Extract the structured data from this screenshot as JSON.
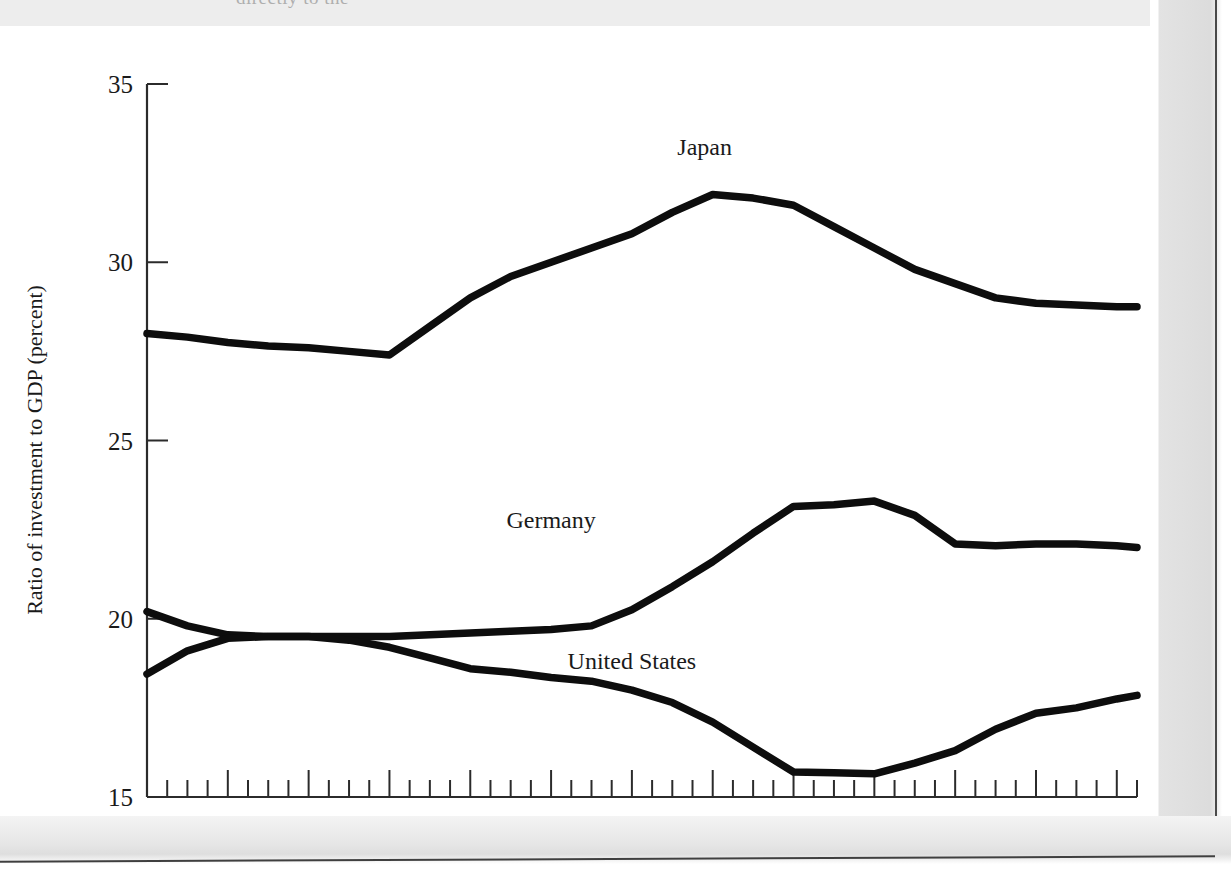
{
  "page": {
    "top_bleed_text": "directly to the",
    "background_color": "#ffffff",
    "line_color": "#0d0d0d",
    "axis_color": "#2b2b2b"
  },
  "chart_data": {
    "type": "line",
    "title": "",
    "xlabel": "",
    "ylabel": "Ratio of investment to GDP (percent)",
    "xlim": [
      1983.0,
      1995.25
    ],
    "ylim": [
      15,
      35
    ],
    "grid": false,
    "legend_position": "inline-labels",
    "y_ticks": [
      15,
      20,
      25,
      30,
      35
    ],
    "y_tick_labels": [
      "15",
      "20",
      "25",
      "30",
      "35"
    ],
    "x_ticks": [
      1984,
      1986,
      1988,
      1990,
      1992,
      1994
    ],
    "x_tick_labels": [
      "1984",
      "1986",
      "1988",
      "1990",
      "1992",
      "1994"
    ],
    "x_major_ticks": [
      1983,
      1984,
      1985,
      1986,
      1987,
      1988,
      1989,
      1990,
      1991,
      1992,
      1993,
      1994,
      1995
    ],
    "x_minor_tick_interval": 0.25,
    "x": [
      1983.0,
      1983.5,
      1984.0,
      1984.5,
      1985.0,
      1985.5,
      1986.0,
      1986.5,
      1987.0,
      1987.5,
      1988.0,
      1988.5,
      1989.0,
      1989.5,
      1990.0,
      1990.5,
      1991.0,
      1991.5,
      1992.0,
      1992.5,
      1993.0,
      1993.5,
      1994.0,
      1994.5,
      1995.0,
      1995.25
    ],
    "series": [
      {
        "name": "Japan",
        "label": "Japan",
        "label_x": 1989.9,
        "label_y": 33.0,
        "values": [
          28.0,
          27.9,
          27.75,
          27.65,
          27.6,
          27.5,
          27.4,
          28.2,
          29.0,
          29.6,
          30.0,
          30.4,
          30.8,
          31.4,
          31.9,
          31.8,
          31.6,
          31.0,
          30.4,
          29.8,
          29.4,
          29.0,
          28.85,
          28.8,
          28.75,
          28.75
        ]
      },
      {
        "name": "Germany",
        "label": "Germany",
        "label_x": 1988.0,
        "label_y": 22.55,
        "values": [
          20.2,
          19.8,
          19.55,
          19.5,
          19.5,
          19.5,
          19.5,
          19.55,
          19.6,
          19.65,
          19.7,
          19.8,
          20.25,
          20.9,
          21.6,
          22.4,
          23.15,
          23.2,
          23.3,
          22.9,
          22.1,
          22.05,
          22.1,
          22.1,
          22.05,
          22.0
        ]
      },
      {
        "name": "United States",
        "label": "United States",
        "label_x": 1989.0,
        "label_y": 18.6,
        "values": [
          18.45,
          19.1,
          19.45,
          19.5,
          19.5,
          19.4,
          19.2,
          18.9,
          18.6,
          18.5,
          18.35,
          18.25,
          18.0,
          17.65,
          17.1,
          16.4,
          15.7,
          15.68,
          15.65,
          15.95,
          16.3,
          16.9,
          17.35,
          17.5,
          17.75,
          17.85
        ]
      }
    ]
  }
}
